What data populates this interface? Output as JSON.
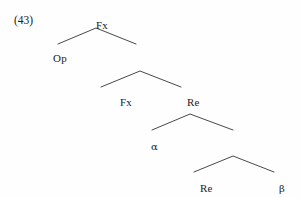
{
  "figure": {
    "example_number": "(43)",
    "line_color": "#33333a",
    "text_color": "#1c1c1c",
    "background_color": "#fefefe"
  },
  "tree": {
    "nodes": [
      {
        "id": "root",
        "label": "Fx",
        "x": 96,
        "y": 20,
        "level": 0,
        "is_greek": false
      },
      {
        "id": "op",
        "label": "Op",
        "x": 53,
        "y": 53,
        "level": 1,
        "is_greek": false
      },
      {
        "id": "fx2",
        "label": "Fx",
        "x": 120,
        "y": 97,
        "level": 2,
        "is_greek": false
      },
      {
        "id": "re2",
        "label": "Re",
        "x": 187,
        "y": 97,
        "level": 2,
        "is_greek": false
      },
      {
        "id": "alpha",
        "label": "α",
        "x": 151,
        "y": 141,
        "level": 3,
        "is_greek": true
      },
      {
        "id": "re3",
        "label": "Re",
        "x": 200,
        "y": 183,
        "level": 4,
        "is_greek": false
      },
      {
        "id": "beta",
        "label": "β",
        "x": 279,
        "y": 183,
        "level": 4,
        "is_greek": true
      }
    ],
    "branches": [
      {
        "id": "peak-1",
        "apex_x": 96,
        "apex_y": 28,
        "left_x": 58,
        "left_y": 44,
        "right_x": 136,
        "right_y": 44
      },
      {
        "id": "peak-2",
        "apex_x": 140,
        "apex_y": 71,
        "left_x": 101,
        "left_y": 87,
        "right_x": 181,
        "right_y": 87
      },
      {
        "id": "peak-3",
        "apex_x": 190,
        "apex_y": 114,
        "left_x": 152,
        "left_y": 130,
        "right_x": 233,
        "right_y": 130
      },
      {
        "id": "peak-4",
        "apex_x": 233,
        "apex_y": 156,
        "left_x": 194,
        "left_y": 172,
        "right_x": 274,
        "right_y": 172
      }
    ]
  }
}
